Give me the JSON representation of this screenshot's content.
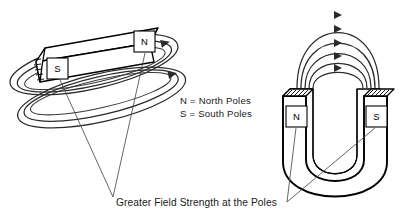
{
  "figure": {
    "background_color": "#ffffff",
    "ink_color": "#000000",
    "field_line_color": "#2b2b2b"
  },
  "legend": {
    "lines": [
      "N  =  North Poles",
      "S  =  South Poles"
    ],
    "north_line": "N  =  North Poles",
    "south_line": "S  =  South Poles"
  },
  "caption": {
    "text": "Greater Field Strength at the Poles"
  },
  "bar_magnet": {
    "name": "bar-magnet",
    "tilt_degrees": -13,
    "poles": [
      {
        "id": "south",
        "letter": "S",
        "position": "left-end"
      },
      {
        "id": "north",
        "letter": "N",
        "position": "right-end"
      }
    ],
    "field_loop_count": 3,
    "field_loop_shape": "ellipse",
    "south_letter": "S",
    "north_letter": "N"
  },
  "horseshoe_magnet": {
    "name": "horseshoe-magnet",
    "poles": [
      {
        "id": "north",
        "letter": "N",
        "position": "left-arm"
      },
      {
        "id": "south",
        "letter": "S",
        "position": "right-arm"
      }
    ],
    "field_arc_count": 5,
    "arc_direction": "north-to-south",
    "north_letter": "N",
    "south_letter": "S"
  }
}
